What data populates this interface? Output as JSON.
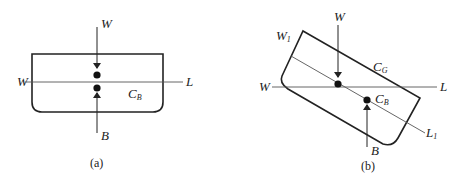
{
  "panels": [
    {
      "id": "a",
      "caption": "(a)",
      "labels": {
        "weight_top": "W",
        "waterline_left": "W",
        "waterline_right": "L",
        "center_buoyancy": "C",
        "center_buoyancy_sub": "B",
        "buoyancy_force": "B"
      }
    },
    {
      "id": "b",
      "caption": "(b)",
      "labels": {
        "weight_top": "W",
        "tilted_waterline_start": "W",
        "tilted_waterline_start_sub": "1",
        "center_gravity": "C",
        "center_gravity_sub": "G",
        "waterline_left": "W",
        "waterline_right": "L",
        "center_buoyancy": "C",
        "center_buoyancy_sub": "B",
        "tilted_waterline_end": "L",
        "tilted_waterline_end_sub": "1",
        "buoyancy_force": "B"
      }
    }
  ],
  "colors": {
    "stroke": "#222222",
    "thin_stroke": "#555555",
    "background": "#ffffff"
  }
}
